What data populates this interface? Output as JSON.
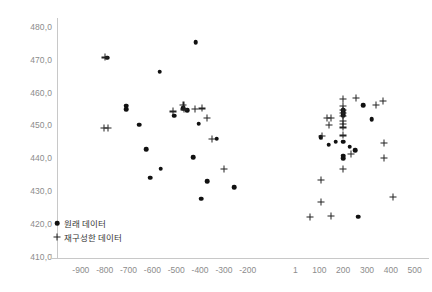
{
  "chart_data": {
    "type": "scatter",
    "title": "",
    "xlabel": "",
    "ylabel": "",
    "xlim": [
      -1000,
      560
    ],
    "ylim": [
      410,
      483
    ],
    "grid": false,
    "legend_position": "inside-bottom-left",
    "xticks": [
      "-900",
      "-800",
      "-700",
      "-600",
      "-500",
      "-400",
      "-300",
      "-200",
      "1",
      "100",
      "200",
      "300",
      "400",
      "500"
    ],
    "xtick_values": [
      -900,
      -800,
      -700,
      -600,
      -500,
      -400,
      -300,
      -200,
      0,
      100,
      200,
      300,
      400,
      500
    ],
    "yticks": [
      "480,0",
      "470,0",
      "460,0",
      "450,0",
      "440,0",
      "430,0",
      "420,0",
      "410,0"
    ],
    "ytick_values": [
      480,
      470,
      460,
      450,
      440,
      430,
      420,
      410
    ],
    "series": [
      {
        "name": "원래 데이터",
        "marker": "circle",
        "color": "#111111",
        "points": [
          [
            -790,
            470.9
          ],
          [
            -710,
            456.3
          ],
          [
            -710,
            455.3
          ],
          [
            -655,
            450.6
          ],
          [
            -625,
            443.1
          ],
          [
            -610,
            434.4
          ],
          [
            -570,
            466.7
          ],
          [
            -565,
            437.2
          ],
          [
            -508,
            453.3
          ],
          [
            -470,
            455.6
          ],
          [
            -455,
            455.0
          ],
          [
            -430,
            440.6
          ],
          [
            -418,
            475.7
          ],
          [
            -405,
            450.8
          ],
          [
            -395,
            428.0
          ],
          [
            -370,
            433.3
          ],
          [
            -330,
            446.3
          ],
          [
            -258,
            431.6
          ],
          [
            105,
            446.8
          ],
          [
            140,
            444.4
          ],
          [
            168,
            445.4
          ],
          [
            200,
            455.0
          ],
          [
            200,
            454.2
          ],
          [
            200,
            453.5
          ],
          [
            200,
            445.4
          ],
          [
            200,
            441.1
          ],
          [
            200,
            440.3
          ],
          [
            228,
            443.9
          ],
          [
            250,
            442.7
          ],
          [
            262,
            422.5
          ],
          [
            285,
            456.4
          ],
          [
            320,
            452.2
          ]
        ]
      },
      {
        "name": "재구성한 데이터",
        "marker": "plus",
        "color": "#222222",
        "points": [
          [
            -800,
            471.0
          ],
          [
            -805,
            449.6
          ],
          [
            -785,
            449.6
          ],
          [
            -470,
            456.6
          ],
          [
            -468,
            455.2
          ],
          [
            -515,
            454.6
          ],
          [
            -420,
            455.4
          ],
          [
            -392,
            455.5
          ],
          [
            -370,
            452.6
          ],
          [
            -300,
            437.0
          ],
          [
            -350,
            446.3
          ],
          [
            132,
            452.5
          ],
          [
            148,
            452.5
          ],
          [
            140,
            450.6
          ],
          [
            110,
            447.2
          ],
          [
            198,
            458.5
          ],
          [
            255,
            458.8
          ],
          [
            200,
            456.2
          ],
          [
            200,
            455.1
          ],
          [
            200,
            454.1
          ],
          [
            200,
            453.1
          ],
          [
            200,
            451.8
          ],
          [
            200,
            450.8
          ],
          [
            200,
            449.7
          ],
          [
            200,
            447.3
          ],
          [
            232,
            441.6
          ],
          [
            105,
            433.8
          ],
          [
            200,
            437.0
          ],
          [
            108,
            427.1
          ],
          [
            60,
            422.6
          ],
          [
            148,
            422.7
          ],
          [
            338,
            456.6
          ],
          [
            368,
            457.9
          ],
          [
            372,
            445.1
          ],
          [
            372,
            440.5
          ],
          [
            410,
            428.6
          ]
        ]
      }
    ]
  },
  "legend": {
    "items": [
      {
        "label": "원래 데이터",
        "marker": "circle"
      },
      {
        "label": "재구성한 데이터",
        "marker": "plus"
      }
    ]
  }
}
